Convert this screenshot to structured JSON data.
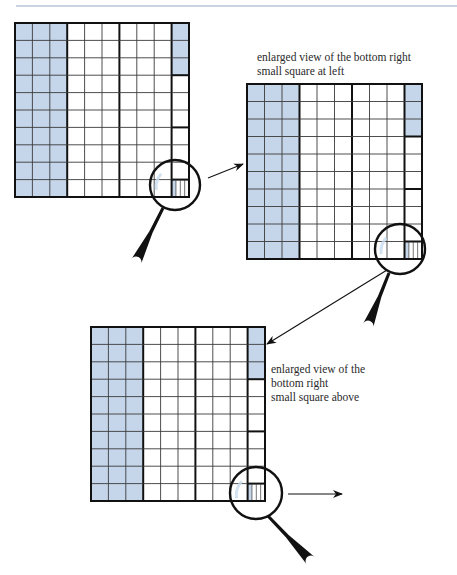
{
  "figure": {
    "top_rule": {
      "x1": 16,
      "y1": 6,
      "x2": 457,
      "y2": 6,
      "color": "#b8c4d4"
    },
    "colors": {
      "shade": "#c5d5ea",
      "line_thin": "#3a3a3a",
      "line_thick": "#111111",
      "lens_reflection": "#c9dcef",
      "handle": "#111111"
    },
    "grid_spec": {
      "columns": 10,
      "rows": 10,
      "shaded_columns": 3,
      "thick_column_after": [
        3,
        6,
        9
      ],
      "last_column_shaded_rows": 3,
      "last_column_thick_row_after": [
        3,
        6,
        9
      ],
      "bottom_right_cell_strips": 4,
      "bottom_right_cell_shaded_strips": 1
    },
    "grids": [
      {
        "id": "grid-original",
        "x": 15,
        "y": 23,
        "size": 174,
        "lens": {
          "cx": 175,
          "cy": 185,
          "r": 25
        },
        "handle": {
          "x1": 163,
          "y1": 208,
          "x2": 136,
          "y2": 262
        }
      },
      {
        "id": "grid-enlarged-1",
        "x": 247,
        "y": 84,
        "size": 175,
        "lens": {
          "cx": 400,
          "cy": 249,
          "r": 25
        },
        "handle": {
          "x1": 389,
          "y1": 273,
          "x2": 368,
          "y2": 326
        }
      },
      {
        "id": "grid-enlarged-2",
        "x": 91,
        "y": 327,
        "size": 174,
        "lens": {
          "cx": 256,
          "cy": 493,
          "r": 26
        },
        "handle": {
          "x1": 268,
          "y1": 516,
          "x2": 311,
          "y2": 561
        }
      }
    ],
    "arrows": [
      {
        "id": "arrow-1-to-2",
        "x1": 208,
        "y1": 178,
        "x2": 243,
        "y2": 164
      },
      {
        "id": "arrow-2-to-3",
        "x1": 387,
        "y1": 270,
        "x2": 267,
        "y2": 344
      },
      {
        "id": "arrow-3-onward",
        "x1": 288,
        "y1": 494,
        "x2": 342,
        "y2": 494
      }
    ],
    "captions": [
      {
        "id": "caption-grid-2",
        "x": 257,
        "y": 50,
        "lines": [
          "enlarged view of the bottom right",
          "small square at left"
        ]
      },
      {
        "id": "caption-grid-3",
        "x": 271,
        "y": 362,
        "lines": [
          "enlarged view of the",
          "bottom right",
          "small square above"
        ]
      }
    ]
  }
}
